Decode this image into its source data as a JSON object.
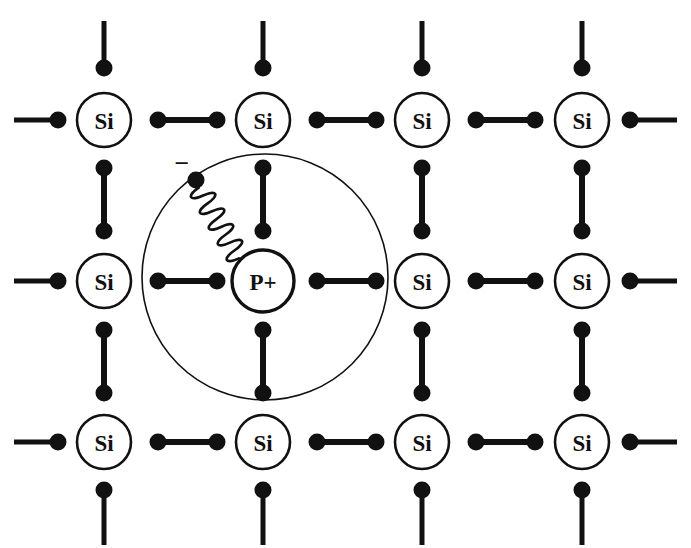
{
  "figure": {
    "kind": "semiconductor-lattice-diagram",
    "width": 691,
    "height": 548,
    "background_color": "#ffffff",
    "ink_color": "#111111"
  },
  "style": {
    "atom_circle_radius": 27,
    "atom_circle_stroke": 2.6,
    "dopant_circle_radius": 31,
    "dopant_circle_stroke": 3.4,
    "orbit_circle_radius": 123,
    "orbit_circle_stroke": 1.6,
    "bond_stroke": 6,
    "bond_dot_radius": 8.5,
    "electron_dot_radius": 8.5,
    "stem_stroke": 5,
    "spring_stroke": 2.6
  },
  "lattice": {
    "columns_x": [
      104,
      263,
      422,
      582
    ],
    "rows_y": [
      120,
      281,
      442
    ],
    "column_spacing": 159,
    "row_spacing": 161,
    "atoms": [
      {
        "id": "si-r1c1",
        "label": "Si",
        "x": 104,
        "y": 120,
        "species": "Si"
      },
      {
        "id": "si-r1c2",
        "label": "Si",
        "x": 263,
        "y": 120,
        "species": "Si"
      },
      {
        "id": "si-r1c3",
        "label": "Si",
        "x": 422,
        "y": 120,
        "species": "Si"
      },
      {
        "id": "si-r1c4",
        "label": "Si",
        "x": 582,
        "y": 120,
        "species": "Si"
      },
      {
        "id": "si-r2c1",
        "label": "Si",
        "x": 104,
        "y": 281,
        "species": "Si"
      },
      {
        "id": "p-r2c2",
        "label": "P+",
        "x": 263,
        "y": 281,
        "species": "P"
      },
      {
        "id": "si-r2c3",
        "label": "Si",
        "x": 422,
        "y": 281,
        "species": "Si"
      },
      {
        "id": "si-r2c4",
        "label": "Si",
        "x": 582,
        "y": 281,
        "species": "Si"
      },
      {
        "id": "si-r3c1",
        "label": "Si",
        "x": 104,
        "y": 442,
        "species": "Si"
      },
      {
        "id": "si-r3c2",
        "label": "Si",
        "x": 263,
        "y": 442,
        "species": "Si"
      },
      {
        "id": "si-r3c3",
        "label": "Si",
        "x": 422,
        "y": 442,
        "species": "Si"
      },
      {
        "id": "si-r3c4",
        "label": "Si",
        "x": 582,
        "y": 442,
        "species": "Si"
      }
    ]
  },
  "bonds": {
    "horizontal": [
      {
        "id": "bond-h-r1-c1c2",
        "x1": 158,
        "x2": 217,
        "y": 120
      },
      {
        "id": "bond-h-r1-c2c3",
        "x1": 317,
        "x2": 376,
        "y": 120
      },
      {
        "id": "bond-h-r1-c3c4",
        "x1": 476,
        "x2": 535,
        "y": 120
      },
      {
        "id": "bond-h-r2-c1c2",
        "x1": 158,
        "x2": 217,
        "y": 281
      },
      {
        "id": "bond-h-r2-c2c3",
        "x1": 317,
        "x2": 376,
        "y": 281
      },
      {
        "id": "bond-h-r2-c3c4",
        "x1": 476,
        "x2": 535,
        "y": 281
      },
      {
        "id": "bond-h-r3-c1c2",
        "x1": 158,
        "x2": 217,
        "y": 442
      },
      {
        "id": "bond-h-r3-c2c3",
        "x1": 317,
        "x2": 376,
        "y": 442
      },
      {
        "id": "bond-h-r3-c3c4",
        "x1": 476,
        "x2": 535,
        "y": 442
      }
    ],
    "vertical": [
      {
        "id": "bond-v-c1-r1r2",
        "x": 104,
        "y1": 168,
        "y2": 231
      },
      {
        "id": "bond-v-c2-r1r2",
        "x": 263,
        "y1": 168,
        "y2": 231
      },
      {
        "id": "bond-v-c3-r1r2",
        "x": 422,
        "y1": 168,
        "y2": 231
      },
      {
        "id": "bond-v-c4-r1r2",
        "x": 582,
        "y1": 168,
        "y2": 231
      },
      {
        "id": "bond-v-c1-r2r3",
        "x": 104,
        "y1": 330,
        "y2": 393
      },
      {
        "id": "bond-v-c2-r2r3",
        "x": 263,
        "y1": 330,
        "y2": 393
      },
      {
        "id": "bond-v-c3-r2r3",
        "x": 422,
        "y1": 330,
        "y2": 393
      },
      {
        "id": "bond-v-c4-r2r3",
        "x": 582,
        "y1": 330,
        "y2": 393
      }
    ]
  },
  "dangling_stems": {
    "top": [
      {
        "id": "stem-top-c1",
        "x": 104,
        "y_dot": 68,
        "y_end": 21
      },
      {
        "id": "stem-top-c2",
        "x": 263,
        "y_dot": 68,
        "y_end": 21
      },
      {
        "id": "stem-top-c3",
        "x": 422,
        "y_dot": 68,
        "y_end": 21
      },
      {
        "id": "stem-top-c4",
        "x": 582,
        "y_dot": 68,
        "y_end": 21
      }
    ],
    "bottom": [
      {
        "id": "stem-bottom-c1",
        "x": 104,
        "y_dot": 490,
        "y_end": 545
      },
      {
        "id": "stem-bottom-c2",
        "x": 263,
        "y_dot": 490,
        "y_end": 545
      },
      {
        "id": "stem-bottom-c3",
        "x": 422,
        "y_dot": 490,
        "y_end": 545
      },
      {
        "id": "stem-bottom-c4",
        "x": 582,
        "y_dot": 490,
        "y_end": 545
      }
    ],
    "left": [
      {
        "id": "stem-left-r1",
        "y": 120,
        "x_dot": 58,
        "x_end": 14
      },
      {
        "id": "stem-left-r2",
        "y": 281,
        "x_dot": 58,
        "x_end": 14
      },
      {
        "id": "stem-left-r3",
        "y": 442,
        "x_dot": 58,
        "x_end": 14
      }
    ],
    "right": [
      {
        "id": "stem-right-r1",
        "y": 120,
        "x_dot": 630,
        "x_end": 677
      },
      {
        "id": "stem-right-r2",
        "y": 281,
        "x_dot": 630,
        "x_end": 677
      },
      {
        "id": "stem-right-r3",
        "y": 442,
        "x_dot": 630,
        "x_end": 677
      }
    ]
  },
  "donor": {
    "label": "P+",
    "center_x": 263,
    "center_y": 281,
    "orbit": {
      "id": "electron-orbit",
      "center_x": 265,
      "center_y": 277,
      "radius": 123
    },
    "electron": {
      "id": "loosely-bound-electron",
      "x": 196,
      "y": 180,
      "charge_symbol": "−",
      "charge_symbol_x": 182,
      "charge_symbol_y": 172
    },
    "spring": {
      "id": "electron-binding-spring",
      "from_x": 196,
      "from_y": 180,
      "to_x": 241,
      "to_y": 259,
      "coil_count": 9,
      "coil_radius": 10
    }
  },
  "legend": {
    "si_label": "Si",
    "dopant_label": "P+",
    "negative_charge": "−"
  }
}
